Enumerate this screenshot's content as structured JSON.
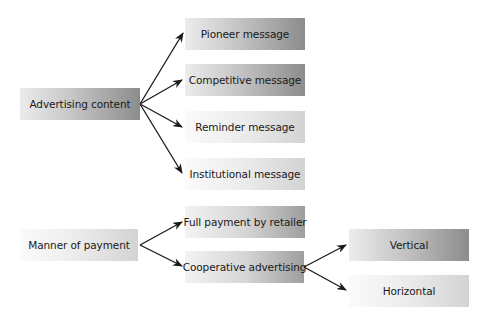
{
  "diagram": {
    "groups": [
      {
        "root": {
          "label": "Advertising content"
        },
        "children": [
          {
            "label": "Pioneer message"
          },
          {
            "label": "Competitive message"
          },
          {
            "label": "Reminder message"
          },
          {
            "label": "Institutional message"
          }
        ]
      },
      {
        "root": {
          "label": "Manner of payment"
        },
        "children": [
          {
            "label": "Full payment by retailer"
          },
          {
            "label": "Cooperative advertising",
            "children": [
              {
                "label": "Vertical"
              },
              {
                "label": "Horizontal"
              }
            ]
          }
        ]
      }
    ],
    "colors": {
      "arrow": "#1a1a1a",
      "box_dark_end": "#8c8c8c",
      "box_light_end": "#d3d3d3",
      "text": "#1a1a1a"
    }
  }
}
